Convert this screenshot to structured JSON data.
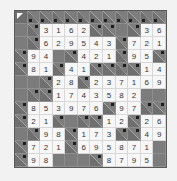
{
  "puzzle": {
    "type": "kakuro",
    "cols": 12,
    "rows": 12,
    "legend": {
      "C": "corner",
      "B": "black",
      "K": "clue",
      "digits": "filled white cell"
    },
    "grid": [
      [
        "C",
        "K",
        "K",
        "K",
        "K",
        "K",
        "K",
        "K",
        "K",
        "K",
        "K",
        "K"
      ],
      [
        "B",
        "K",
        "3",
        "1",
        "6",
        "2",
        "K",
        "K",
        "B",
        "K",
        "3",
        "6"
      ],
      [
        "B",
        "K",
        "6",
        "2",
        "9",
        "5",
        "4",
        "3",
        "K",
        "7",
        "2",
        "1"
      ],
      [
        "K",
        "9",
        "4",
        "B",
        "K",
        "4",
        "2",
        "1",
        "K",
        "9",
        "5",
        "K"
      ],
      [
        "K",
        "8",
        "1",
        "K",
        "4",
        "1",
        "K",
        "K",
        "K",
        "K",
        "1",
        "4"
      ],
      [
        "B",
        "B",
        "K",
        "2",
        "8",
        "K",
        "2",
        "3",
        "7",
        "1",
        "6",
        "9"
      ],
      [
        "B",
        "K",
        "K",
        "1",
        "7",
        "4",
        "3",
        "5",
        "8",
        "2",
        "B",
        "B"
      ],
      [
        "K",
        "8",
        "5",
        "3",
        "9",
        "7",
        "6",
        "K",
        "9",
        "7",
        "K",
        "K"
      ],
      [
        "K",
        "2",
        "1",
        "K",
        "B",
        "K",
        "K",
        "1",
        "2",
        "K",
        "2",
        "6"
      ],
      [
        "B",
        "K",
        "9",
        "8",
        "K",
        "1",
        "7",
        "3",
        "K",
        "K",
        "4",
        "9"
      ],
      [
        "K",
        "7",
        "2",
        "1",
        "K",
        "6",
        "9",
        "5",
        "8",
        "7",
        "1",
        "B"
      ],
      [
        "K",
        "9",
        "8",
        "B",
        "B",
        "B",
        "K",
        "8",
        "7",
        "9",
        "5",
        "B"
      ]
    ]
  }
}
